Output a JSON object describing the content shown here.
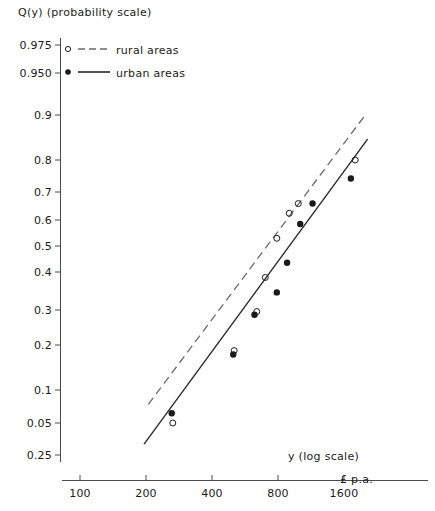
{
  "chart_data": {
    "type": "scatter",
    "title": "",
    "ylabel": "Q(y) (probability scale)",
    "xlabel": "y (log scale)",
    "x_unit": "£ p.a.",
    "xscale": "log",
    "yscale": "probability",
    "grid": false,
    "legend_position": "top-left",
    "xticks": [
      100,
      200,
      400,
      800,
      1600
    ],
    "xtick_labels": [
      "100",
      "200",
      "400",
      "800",
      "1600"
    ],
    "yticks": [
      0.975,
      0.95,
      0.9,
      0.8,
      0.7,
      0.6,
      0.5,
      0.4,
      0.3,
      0.2,
      0.1,
      0.05,
      0.025
    ],
    "ytick_labels": [
      "0.975",
      "0.950",
      "0.9",
      "0.8",
      "0.7",
      "0.6",
      "0.5",
      "0.4",
      "0.3",
      "0.2",
      "0.1",
      "0.05",
      "0.25"
    ],
    "xlim": [
      90,
      2100
    ],
    "ylim": [
      0.02,
      0.99
    ],
    "series": [
      {
        "name": "rural areas",
        "marker": "open-circle",
        "line": "dashed",
        "color": "#1a1a1a",
        "points": [
          {
            "x": 265,
            "y": 0.05
          },
          {
            "x": 505,
            "y": 0.185
          },
          {
            "x": 640,
            "y": 0.295
          },
          {
            "x": 700,
            "y": 0.385
          },
          {
            "x": 790,
            "y": 0.53
          },
          {
            "x": 900,
            "y": 0.625
          },
          {
            "x": 990,
            "y": 0.66
          },
          {
            "x": 1800,
            "y": 0.8
          }
        ],
        "fit_line": {
          "x1": 205,
          "y1": 0.075,
          "x2": 2000,
          "y2": 0.9
        }
      },
      {
        "name": "urban areas",
        "marker": "filled-circle",
        "line": "solid",
        "color": "#1a1a1a",
        "points": [
          {
            "x": 262,
            "y": 0.062
          },
          {
            "x": 500,
            "y": 0.175
          },
          {
            "x": 625,
            "y": 0.285
          },
          {
            "x": 790,
            "y": 0.345
          },
          {
            "x": 880,
            "y": 0.435
          },
          {
            "x": 1010,
            "y": 0.585
          },
          {
            "x": 1150,
            "y": 0.66
          },
          {
            "x": 1720,
            "y": 0.745
          }
        ],
        "fit_line": {
          "x1": 196,
          "y1": 0.032,
          "x2": 2050,
          "y2": 0.852
        }
      }
    ]
  },
  "legend": {
    "items": [
      {
        "label": "rural areas",
        "marker": "open-circle",
        "line": "dashed"
      },
      {
        "label": "urban areas",
        "marker": "filled-circle",
        "line": "solid"
      }
    ]
  }
}
